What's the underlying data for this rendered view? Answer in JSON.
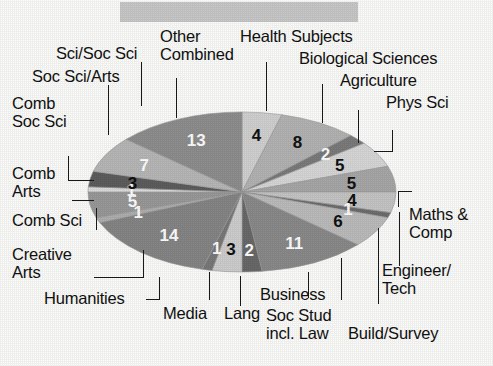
{
  "header": {
    "title_bar_label": "",
    "title_bar_color": "#c9c9c9"
  },
  "chart_data": {
    "type": "pie",
    "title": "",
    "subtitle": "",
    "xlabel": "",
    "ylabel": "",
    "legend_position": "callout-labels",
    "grid": false,
    "total": 100,
    "units": "percent",
    "categories": [
      "Health Subjects",
      "Biological Sciences",
      "Agriculture",
      "Phys Sci",
      "Maths & Comp",
      "Engineer/Tech",
      "Build/Survey",
      "Soc Stud incl. Law",
      "Business",
      "Lang",
      "Media",
      "Humanities",
      "Creative Arts",
      "Comb Sci",
      "Comb Arts",
      "Comb Soc Sci",
      "Soc Sci/Arts",
      "Sci/Soc Sci",
      "Other Combined"
    ],
    "values": [
      4,
      8,
      2,
      5,
      5,
      4,
      1,
      6,
      11,
      2,
      3,
      1,
      14,
      1,
      5,
      1,
      3,
      7,
      13
    ],
    "slices": [
      {
        "label": "Health Subjects",
        "value": 4,
        "data_label": "4",
        "color": "#d2d2d2",
        "label_color": "#111111"
      },
      {
        "label": "Biological Sciences",
        "value": 8,
        "color": "#b4b4b4",
        "data_label": "8",
        "label_color": "#111111"
      },
      {
        "label": "Agriculture",
        "value": 2,
        "color": "#7c7c7c",
        "data_label": "2",
        "label_color": "#ffffff"
      },
      {
        "label": "Phys Sci",
        "value": 5,
        "color": "#d8d8d8",
        "data_label": "5",
        "label_color": "#111111"
      },
      {
        "label": "Maths & Comp",
        "value": 5,
        "color": "#a8a8a8",
        "data_label": "5",
        "label_color": "#111111"
      },
      {
        "label": "Engineer/Tech",
        "value": 4,
        "color": "#c6c6c6",
        "data_label": "4",
        "label_color": "#111111"
      },
      {
        "label": "Build/Survey",
        "value": 1,
        "color": "#6e6e6e",
        "data_label": "1",
        "label_color": "#ffffff"
      },
      {
        "label": "Soc Stud incl. Law",
        "value": 6,
        "color": "#bdbdbd",
        "data_label": "6",
        "label_color": "#111111"
      },
      {
        "label": "Business",
        "value": 11,
        "color": "#8b8b8b",
        "data_label": "11",
        "label_color": "#ffffff"
      },
      {
        "label": "Lang",
        "value": 2,
        "color": "#6a6a6a",
        "data_label": "2",
        "label_color": "#ffffff"
      },
      {
        "label": "Media",
        "value": 3,
        "color": "#cfcfcf",
        "data_label": "3",
        "label_color": "#111111"
      },
      {
        "label": "Humanities",
        "value": 1,
        "color": "#7a7a7a",
        "data_label": "1",
        "label_color": "#ffffff"
      },
      {
        "label": "Creative Arts",
        "value": 14,
        "color": "#868686",
        "data_label": "14",
        "label_color": "#ffffff"
      },
      {
        "label": "Comb Sci",
        "value": 1,
        "color": "#b0b0b0",
        "data_label": "1",
        "label_color": "#ffffff"
      },
      {
        "label": "Comb Arts",
        "value": 5,
        "color": "#9a9a9a",
        "data_label": "5",
        "label_color": "#ffffff"
      },
      {
        "label": "Comb Soc Sci",
        "value": 1,
        "color": "#dcdcdc",
        "data_label": "1",
        "label_color": "#ffffff"
      },
      {
        "label": "Soc Sci/Arts",
        "value": 3,
        "color": "#5e5e5e",
        "data_label": "3",
        "label_color": "#111111"
      },
      {
        "label": "Sci/Soc Sci",
        "value": 7,
        "color": "#b8b8b8",
        "data_label": "7",
        "label_color": "#ffffff"
      },
      {
        "label": "Other Combined",
        "value": 13,
        "color": "#8f8f8f",
        "data_label": "13",
        "label_color": "#ffffff"
      }
    ]
  },
  "callouts": {
    "sci_soc_sci": "Sci/Soc Sci",
    "other": "Other",
    "combined": "Combined",
    "health_subjects": "Health Subjects",
    "biological_sciences": "Biological Sciences",
    "soc_sci_arts": "Soc Sci/Arts",
    "agriculture": "Agriculture",
    "phys_sci": "Phys Sci",
    "comb": "Comb",
    "soc_sci": "Soc Sci",
    "comb_arts_1": "Comb",
    "comb_arts_2": "Arts",
    "comb_sci": "Comb Sci",
    "creative": "Creative",
    "arts": "Arts",
    "humanities": "Humanities",
    "media": "Media",
    "lang": "Lang",
    "soc_stud": "Soc Stud",
    "incl_law": "incl. Law",
    "business": "Business",
    "build_survey": "Build/Survey",
    "engineer": "Engineer/",
    "tech": "Tech",
    "maths": "Maths &",
    "comp": "Comp"
  },
  "slice_labels": {
    "health": "4",
    "biological": "8",
    "agriculture": "2",
    "physsci": "5",
    "maths": "5",
    "engineer": "4",
    "build": "1",
    "socstud": "6",
    "business": "11",
    "lang": "2",
    "media": "3",
    "humanities": "1",
    "creative": "14",
    "combsci": "1",
    "combarts": "5",
    "combsocsci": "1",
    "socsciarts": "3",
    "scisocsci": "7",
    "othercombined": "13"
  }
}
